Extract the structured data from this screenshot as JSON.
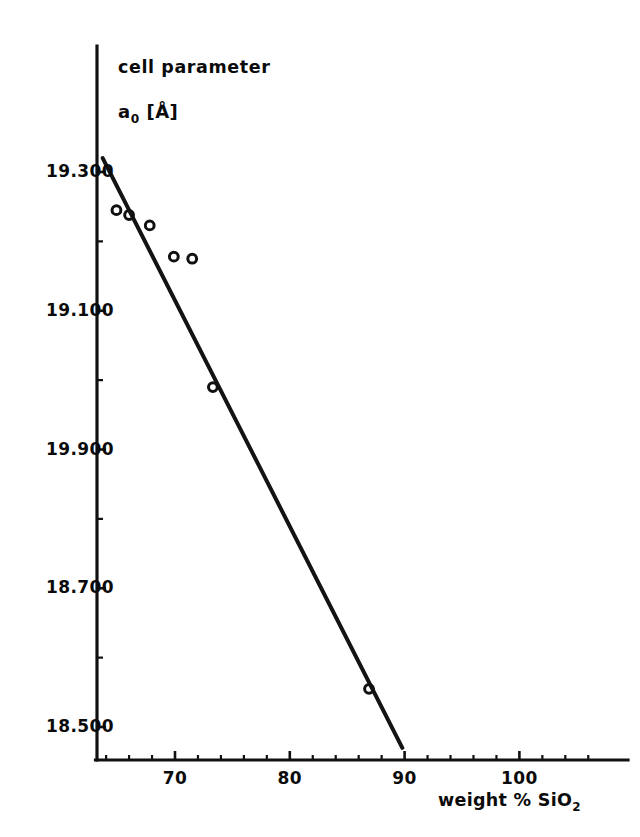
{
  "figure": {
    "background_color": "#ffffff",
    "ink_color": "#111111"
  },
  "yaxis": {
    "title_line1": "cell parameter",
    "title_line2_symbol": "a",
    "title_line2_subscript": "0",
    "title_line2_unit": "[Å]",
    "tick_labels": [
      "19.300",
      "19.100",
      "19.900",
      "18.700",
      "18.500"
    ]
  },
  "xaxis": {
    "title_text": "weight % SiO",
    "title_subscript": "2",
    "tick_labels": [
      "70",
      "80",
      "90",
      "100"
    ]
  },
  "chart_data": {
    "type": "scatter",
    "title": "",
    "subtitle": "",
    "xlabel": "weight % SiO2",
    "ylabel": "cell parameter a0 [Å]",
    "xlim": [
      63.0,
      109.0
    ],
    "ylim": [
      18.44,
      19.34
    ],
    "grid": false,
    "legend": null,
    "marker_style": "open-circle",
    "x_ticks_major": [
      70,
      80,
      90,
      100
    ],
    "x_ticks_minor": [
      64,
      66,
      68,
      72,
      74,
      76,
      78,
      82,
      84,
      86,
      88,
      92,
      94,
      96,
      98,
      102,
      104,
      106
    ],
    "y_ticks_major": [
      19.3,
      19.1,
      19.9,
      18.7,
      18.5
    ],
    "y_ticks_minor": [
      19.2,
      19.0,
      18.8,
      18.6
    ],
    "y_tick_labels_as_printed": [
      "19.300",
      "19.100",
      "19.900",
      "18.700",
      "18.500"
    ],
    "note_on_y_labels": "third label printed as 19.900 in the scan",
    "series": [
      {
        "name": "measured cell parameter",
        "marker": "open-circle",
        "points": [
          {
            "x": 64.9,
            "y": 19.245
          },
          {
            "x": 66.0,
            "y": 19.238
          },
          {
            "x": 67.8,
            "y": 19.223
          },
          {
            "x": 69.9,
            "y": 19.178
          },
          {
            "x": 71.5,
            "y": 19.175
          },
          {
            "x": 73.3,
            "y": 18.99
          },
          {
            "x": 86.9,
            "y": 18.555
          }
        ]
      },
      {
        "name": "linear fit",
        "type": "line",
        "endpoints": [
          {
            "x": 63.7,
            "y": 19.32
          },
          {
            "x": 89.8,
            "y": 18.47
          }
        ]
      }
    ]
  },
  "geometry": {
    "y_axis_x_px": 97,
    "x_axis_y_px": 760,
    "x_px_at_70": 175,
    "px_per_x_unit": 11.48,
    "y_px_at_first_label": 172,
    "py_per_y_step": 138.75,
    "marker_radius_px": 4.4,
    "y_tick_label_x_px": 28,
    "x_axis_right_end_px": 628,
    "y_axis_top_end_px": 46
  }
}
